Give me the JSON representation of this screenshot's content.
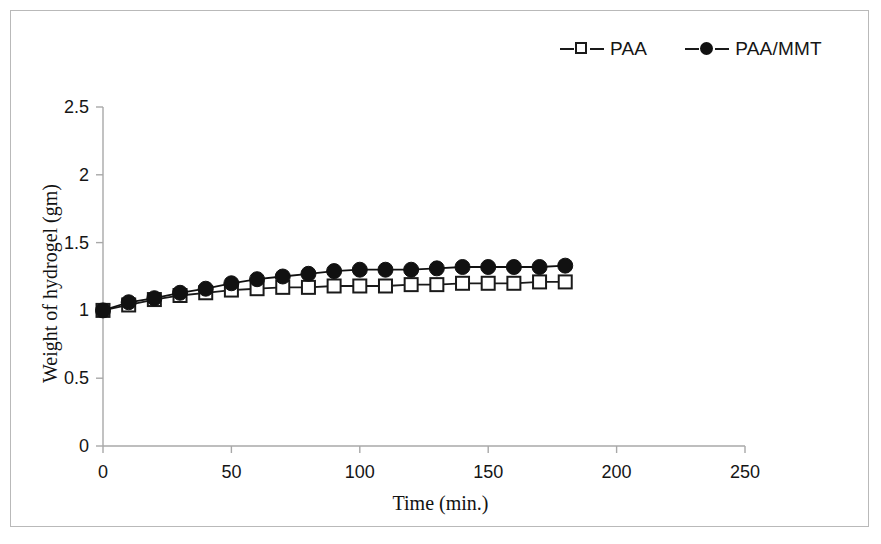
{
  "chart_data": {
    "type": "line",
    "title": "",
    "xlabel": "Time (min.)",
    "ylabel": "Weight of hydrogel (gm)",
    "xlim": [
      0,
      250
    ],
    "ylim": [
      0,
      2.5
    ],
    "xticks": [
      0,
      50,
      100,
      150,
      200,
      250
    ],
    "yticks": [
      0,
      0.5,
      1,
      1.5,
      2,
      2.5
    ],
    "xtick_labels": [
      "0",
      "50",
      "100",
      "150",
      "200",
      "250"
    ],
    "ytick_labels": [
      "0",
      "0.5",
      "1",
      "1.5",
      "2",
      "2.5"
    ],
    "grid": false,
    "legend_position": "top-right",
    "x": [
      0,
      10,
      20,
      30,
      40,
      50,
      60,
      70,
      80,
      90,
      100,
      110,
      120,
      130,
      140,
      150,
      160,
      170,
      180
    ],
    "series": [
      {
        "name": "PAA",
        "marker": "open-square",
        "color": "#1a1a1a",
        "values": [
          1.0,
          1.04,
          1.08,
          1.11,
          1.13,
          1.15,
          1.16,
          1.17,
          1.17,
          1.18,
          1.18,
          1.18,
          1.19,
          1.19,
          1.2,
          1.2,
          1.2,
          1.21,
          1.21
        ]
      },
      {
        "name": "PAA/MMT",
        "marker": "filled-circle",
        "color": "#111111",
        "values": [
          1.0,
          1.06,
          1.09,
          1.13,
          1.16,
          1.2,
          1.23,
          1.25,
          1.27,
          1.29,
          1.3,
          1.3,
          1.3,
          1.31,
          1.32,
          1.32,
          1.32,
          1.32,
          1.33
        ]
      }
    ]
  },
  "legend": {
    "entries": [
      {
        "label": "PAA"
      },
      {
        "label": "PAA/MMT"
      }
    ]
  },
  "axes": {
    "x_title": "Time (min.)",
    "y_title": "Weight of hydrogel (gm)"
  }
}
